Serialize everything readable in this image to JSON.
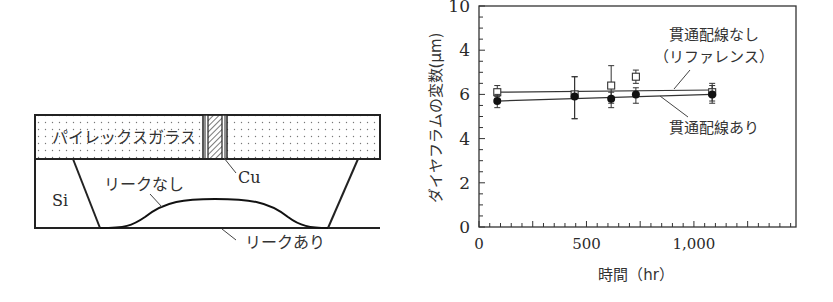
{
  "diagram": {
    "glass_label": "パイレックスガラス",
    "si_label": "Si",
    "cu_label": "Cu",
    "no_leak_label": "リークなし",
    "leak_label": "リークあり"
  },
  "chart_data": {
    "type": "scatter",
    "title": "",
    "xlabel": "時間（hr）",
    "ylabel": "ダイヤフラムの変数(μm)",
    "xlim": [
      0,
      1475
    ],
    "ylim": [
      0,
      10
    ],
    "x_ticks": [
      {
        "value": 0,
        "label": "0"
      },
      {
        "value": 500,
        "label": "500"
      },
      {
        "value": 1000,
        "label": "1,000"
      }
    ],
    "y_ticks": [
      {
        "value": 10,
        "label": "10"
      },
      {
        "value": 8,
        "label": "4"
      },
      {
        "value": 6,
        "label": "6"
      },
      {
        "value": 4,
        "label": "4"
      },
      {
        "value": 2,
        "label": "2"
      },
      {
        "value": 0,
        "label": "0"
      }
    ],
    "grid": false,
    "series": [
      {
        "name": "貫通配線なし（リファレンス）",
        "marker": "open-square",
        "x": [
          85,
          445,
          615,
          730,
          1085
        ],
        "y": [
          6.1,
          6.0,
          6.4,
          6.8,
          6.1
        ],
        "err_low": [
          5.9,
          4.9,
          5.6,
          6.5,
          5.7
        ],
        "err_high": [
          6.4,
          6.8,
          7.3,
          7.1,
          6.5
        ],
        "fit_line": {
          "x": [
            85,
            1085
          ],
          "y": [
            6.1,
            6.2
          ]
        }
      },
      {
        "name": "貫通配線あり",
        "marker": "filled-circle",
        "x": [
          85,
          445,
          615,
          730,
          1085
        ],
        "y": [
          5.7,
          5.9,
          5.8,
          6.0,
          6.0
        ],
        "err_low": [
          5.4,
          4.9,
          5.4,
          5.6,
          5.6
        ],
        "err_high": [
          6.0,
          6.8,
          6.1,
          6.3,
          6.4
        ],
        "fit_line": {
          "x": [
            85,
            1085
          ],
          "y": [
            5.7,
            6.0
          ]
        }
      }
    ],
    "annotations": [
      {
        "text_line1": "貫通配線なし",
        "text_line2": "（リファレンス）"
      },
      {
        "text": "貫通配線あり"
      }
    ]
  }
}
